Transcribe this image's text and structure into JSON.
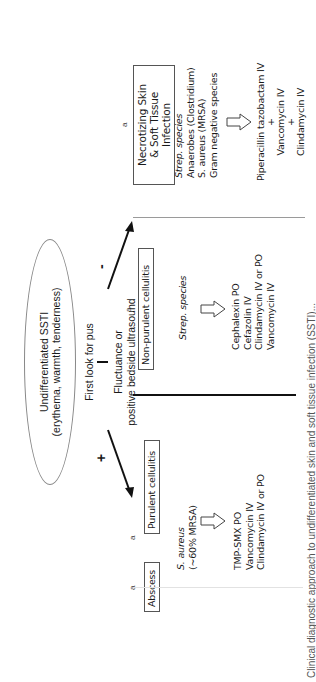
{
  "root": {
    "title": "Undifferentiated SSTI",
    "subtitle": "(erythema, warmth, tenderness)"
  },
  "first_step": "First look for pus",
  "criterion": {
    "line1": "Fluctuance or",
    "line2": "positive bedside ultrasound"
  },
  "signs": {
    "positive": "+",
    "negative": "-"
  },
  "branches": [
    {
      "id": "abscess",
      "label": "Abscess",
      "superscript": "a"
    },
    {
      "id": "purulent",
      "label": "Purulent cellulitis",
      "superscript": "a",
      "organisms": [
        "S. aureus",
        "(~60% MRSA)"
      ],
      "treatments": [
        "TMP-SMX PO",
        "Vancomycin IV",
        "Clindamycin IV or PO"
      ]
    },
    {
      "id": "nonpurulent",
      "label": "Non-purulent cellulitis",
      "superscript": "a",
      "organisms": [
        "Strep. species"
      ],
      "treatments": [
        "Cephalexin PO",
        "Cefazolin IV",
        "Clindamycin IV or PO",
        "Vancomycin IV"
      ]
    },
    {
      "id": "necrotizing",
      "label_line1": "Necrotizing Skin",
      "label_line2": "& Soft Tissue Infection",
      "superscript": "a",
      "organisms": [
        "Strep. species",
        "Anaerobes (Clostridium)",
        "S. aureus (MRSA)",
        "Gram negative species"
      ],
      "treatments": [
        "Piperacillin tazobactam IV",
        "+",
        "Vancomycin IV",
        "+",
        "Clindamycin IV"
      ]
    }
  ],
  "caption": "Clinical diagnostic approach to undifferentiated skin and soft tissue infection (SSTI)..."
}
